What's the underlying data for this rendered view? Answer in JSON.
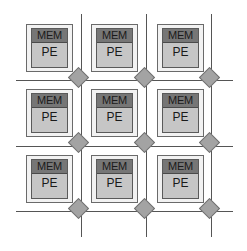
{
  "diagram": {
    "type": "mesh-network-on-chip",
    "grid": {
      "rows": 3,
      "cols": 3
    },
    "tile_labels": {
      "memory": "MEM",
      "processing_element": "PE"
    },
    "tiles": [
      {
        "row": 0,
        "col": 0,
        "mem": "MEM",
        "pe": "PE"
      },
      {
        "row": 0,
        "col": 1,
        "mem": "MEM",
        "pe": "PE"
      },
      {
        "row": 0,
        "col": 2,
        "mem": "MEM",
        "pe": "PE"
      },
      {
        "row": 1,
        "col": 0,
        "mem": "MEM",
        "pe": "PE"
      },
      {
        "row": 1,
        "col": 1,
        "mem": "MEM",
        "pe": "PE"
      },
      {
        "row": 1,
        "col": 2,
        "mem": "MEM",
        "pe": "PE"
      },
      {
        "row": 2,
        "col": 0,
        "mem": "MEM",
        "pe": "PE"
      },
      {
        "row": 2,
        "col": 1,
        "mem": "MEM",
        "pe": "PE"
      },
      {
        "row": 2,
        "col": 2,
        "mem": "MEM",
        "pe": "PE"
      }
    ],
    "routers": {
      "count": 9,
      "shape": "diamond"
    },
    "colors": {
      "line": "#555555",
      "mem_header": "#767676",
      "pe_body": "#c6c6c6",
      "tile_frame": "#f2f2f2",
      "router": "#a3a3a3"
    }
  }
}
